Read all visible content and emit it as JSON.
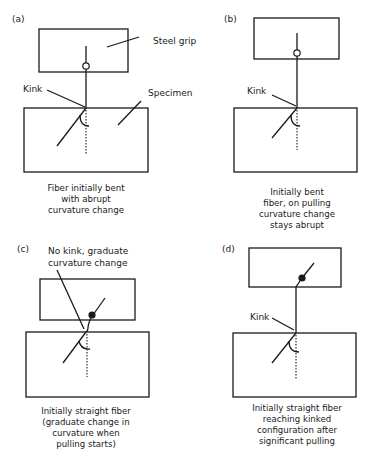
{
  "panels": [
    {
      "id": "a",
      "tag": "(a)",
      "labels": {
        "grip": "Steel grip",
        "kink": "Kink",
        "specimen": "Specimen"
      },
      "caption": [
        "Fiber initially bent",
        "with abrupt",
        "curvature change"
      ]
    },
    {
      "id": "b",
      "tag": "(b)",
      "labels": {
        "kink": "Kink"
      },
      "caption": [
        "Initially bent",
        "fiber, on pulling",
        "curvature change",
        "stays abrupt"
      ]
    },
    {
      "id": "c",
      "tag": "(c)",
      "labels": {
        "note": [
          "No kink, graduate",
          "curvature change"
        ]
      },
      "caption": [
        "Initially straight fiber",
        "(graduate change in",
        "curvature  when",
        "pulling starts)"
      ]
    },
    {
      "id": "d",
      "tag": "(d)",
      "labels": {
        "kink": "Kink"
      },
      "caption": [
        "Initially straight fiber",
        "reaching kinked",
        "configuration after",
        "significant pulling"
      ]
    }
  ]
}
